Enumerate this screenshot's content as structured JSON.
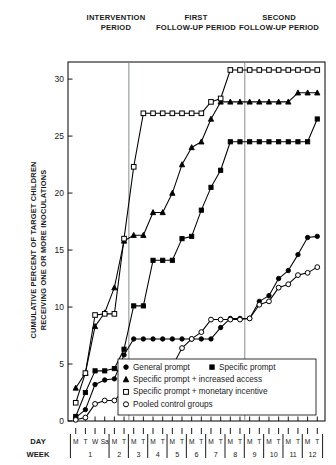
{
  "figure": {
    "period_headers": [
      {
        "line1": "INTERVENTION",
        "line2": "PERIOD"
      },
      {
        "line1": "FIRST",
        "line2": "FOLLOW-UP PERIOD"
      },
      {
        "line1": "SECOND",
        "line2": "FOLLOW-UP PERIOD"
      }
    ],
    "axis_captions": {
      "day": "DAY",
      "week": "WEEK"
    }
  },
  "chart_data": {
    "type": "line",
    "title": "",
    "xlabel": "DAY / WEEK",
    "ylabel": "CUMULATIVE PERCENT OF TARGET CHILDREN RECEIVING ONE OR MORE INOCULATIONS",
    "ylim": [
      0,
      31.5
    ],
    "yticks": [
      0,
      5,
      10,
      15,
      20,
      25,
      30
    ],
    "ytick_labels": [
      "0",
      "5",
      "10",
      "15",
      "20",
      "25",
      "30"
    ],
    "grid": false,
    "legend_position": "bottom-right",
    "x_days": [
      "M",
      "T",
      "W",
      "Sa",
      "M",
      "T",
      "M",
      "T",
      "M",
      "T",
      "M",
      "T",
      "M",
      "T",
      "M",
      "T",
      "M",
      "T",
      "M",
      "T",
      "M",
      "T",
      "M",
      "T",
      "M",
      "T"
    ],
    "x_weeks": [
      "1",
      "2",
      "3",
      "4",
      "5",
      "6",
      "7",
      "8",
      "9",
      "10",
      "11",
      "12"
    ],
    "week_day_counts": [
      4,
      2,
      2,
      2,
      2,
      2,
      2,
      2,
      2,
      2,
      2,
      2
    ],
    "dividers": [
      {
        "label": "after week 2 T",
        "after_index": 5
      },
      {
        "label": "after week 8 T",
        "after_index": 17
      }
    ],
    "series": [
      {
        "name": "General prompt",
        "marker": "filled-circle",
        "values": [
          0.3,
          1.0,
          3.2,
          3.6,
          3.7,
          5.8,
          7.2,
          7.2,
          7.2,
          7.2,
          7.2,
          7.2,
          7.2,
          7.2,
          7.2,
          8.2,
          9.0,
          9.0,
          9.0,
          10.5,
          11.0,
          12.5,
          13.2,
          14.6,
          16.1,
          16.2
        ]
      },
      {
        "name": "Specific prompt",
        "marker": "filled-square",
        "values": [
          0.4,
          2.5,
          4.4,
          4.4,
          4.6,
          6.3,
          10.1,
          10.1,
          14.1,
          14.1,
          14.1,
          16.0,
          16.2,
          18.5,
          20.5,
          22.0,
          24.5,
          24.5,
          24.5,
          24.5,
          24.5,
          24.5,
          24.5,
          24.5,
          24.5,
          26.5
        ]
      },
      {
        "name": "Specific prompt + increased access",
        "marker": "filled-triangle",
        "values": [
          2.9,
          4.2,
          8.3,
          9.5,
          11.7,
          15.8,
          16.3,
          16.3,
          18.3,
          18.3,
          20.0,
          22.5,
          24.0,
          24.5,
          26.5,
          28.0,
          28.0,
          28.0,
          28.0,
          28.0,
          28.0,
          28.0,
          28.0,
          28.8,
          28.8,
          28.8
        ]
      },
      {
        "name": "Specific prompt + monetary incentive",
        "marker": "open-square",
        "values": [
          1.6,
          4.2,
          9.3,
          9.4,
          9.4,
          16.0,
          22.3,
          27.0,
          27.0,
          27.0,
          27.0,
          27.0,
          27.0,
          27.0,
          28.0,
          28.3,
          30.8,
          30.8,
          30.8,
          30.8,
          30.8,
          30.8,
          30.8,
          30.8,
          30.8,
          30.8
        ]
      },
      {
        "name": "Pooled control groups",
        "marker": "open-circle",
        "values": [
          0.1,
          0.3,
          1.5,
          1.8,
          1.8,
          2.7,
          4.4,
          4.6,
          4.7,
          4.7,
          4.8,
          6.4,
          7.2,
          7.8,
          8.9,
          8.9,
          8.9,
          8.9,
          9.0,
          10.2,
          10.5,
          11.7,
          12.0,
          12.8,
          13.0,
          13.5
        ]
      }
    ],
    "legend": [
      {
        "label": "General prompt",
        "marker": "filled-circle"
      },
      {
        "label": "Specific prompt",
        "marker": "filled-square"
      },
      {
        "label": "Specific prompt + increased access",
        "marker": "filled-triangle"
      },
      {
        "label": "Specific prompt + monetary incentive",
        "marker": "open-square"
      },
      {
        "label": "Pooled control groups",
        "marker": "open-circle"
      }
    ]
  }
}
